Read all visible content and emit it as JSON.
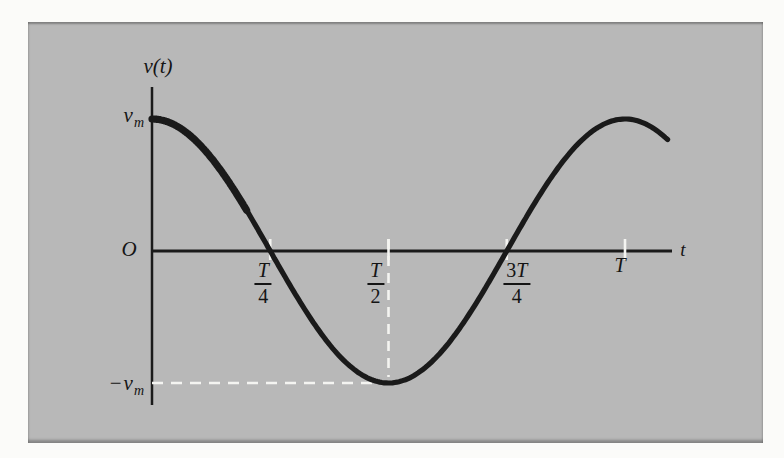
{
  "figure": {
    "y_axis_title": "v(t)",
    "x_axis_title": "t",
    "origin_label": "O",
    "y_max": {
      "sign": "",
      "base": "v",
      "sub": "m"
    },
    "y_min": {
      "sign": "−",
      "base": "v",
      "sub": "m"
    },
    "x_ticks": [
      {
        "prefix": "",
        "sym": "T",
        "den": "4"
      },
      {
        "prefix": "",
        "sym": "T",
        "den": "2"
      },
      {
        "prefix": "3",
        "sym": "T",
        "den": "4"
      },
      {
        "prefix": "",
        "sym": "T",
        "den": ""
      }
    ],
    "colors": {
      "panel_background": "#b8b8b8",
      "curve": "#1a1a1a",
      "axis": "#1a1a1a",
      "dashed_guides": "#f4f4f1",
      "page_background": "#fbfbf9"
    }
  },
  "chart_data": {
    "type": "line",
    "title": "",
    "function": "v(t) = v_m cos(2πt/T)",
    "amplitude_vm": 1,
    "period_T": 1,
    "x_range_T": [
      0,
      1.09
    ],
    "y_range_vm": [
      -1,
      1
    ],
    "xlabel": "t",
    "ylabel": "v(t)",
    "x_tick_labels": [
      "T/4",
      "T/2",
      "3T/4",
      "T"
    ],
    "x_tick_positions_T": [
      0.25,
      0.5,
      0.75,
      1
    ],
    "y_tick_labels": [
      "v_m",
      "-v_m"
    ],
    "y_tick_positions_vm": [
      1,
      -1
    ],
    "key_points_T_vm": [
      [
        0,
        1
      ],
      [
        0.25,
        0
      ],
      [
        0.5,
        -1
      ],
      [
        0.75,
        0
      ],
      [
        1,
        1
      ]
    ],
    "annotations": [
      {
        "type": "dashed_line",
        "from_T_vm": [
          0.5,
          0
        ],
        "to_T_vm": [
          0.5,
          -1
        ]
      },
      {
        "type": "dashed_line",
        "from_T_vm": [
          0,
          -1
        ],
        "to_T_vm": [
          0.5,
          -1
        ]
      }
    ],
    "grid": false,
    "legend": false
  }
}
